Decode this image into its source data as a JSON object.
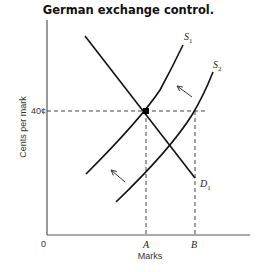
{
  "chart_data": {
    "type": "line",
    "title": "German exchange control.",
    "xlabel": "Marks",
    "ylabel": "Cents per mark",
    "origin_label": "0",
    "y_ticks": [
      {
        "label": "40¢",
        "value": 40
      }
    ],
    "x_ticks": [
      {
        "label": "A",
        "value": "A"
      },
      {
        "label": "B",
        "value": "B"
      }
    ],
    "xlim": [
      0,
      100
    ],
    "ylim": [
      0,
      100
    ],
    "grid": false,
    "series": [
      {
        "name": "D1",
        "label": "D",
        "sub": "1",
        "shape": "downward-sloping straight line",
        "points": [
          [
            19,
            92
          ],
          [
            73,
            27
          ]
        ]
      },
      {
        "name": "S1",
        "label": "S",
        "sub": "1",
        "shape": "upward-sloping convex curve",
        "points": [
          [
            19,
            28
          ],
          [
            40,
            42
          ],
          [
            49,
            57
          ],
          [
            60,
            75
          ],
          [
            66,
            87
          ]
        ]
      },
      {
        "name": "S2",
        "label": "S",
        "sub": "2",
        "shape": "upward-sloping convex curve",
        "points": [
          [
            34,
            15
          ],
          [
            55,
            30
          ],
          [
            73,
            57
          ],
          [
            80,
            75
          ],
          [
            82,
            75
          ]
        ]
      }
    ],
    "annotations": [
      {
        "type": "point",
        "name": "equilibrium",
        "x": "A",
        "y": 40,
        "note": "S1 ∩ D1"
      },
      {
        "type": "dashed-line",
        "from": "40¢ on y-axis",
        "to": "B at 40¢"
      },
      {
        "type": "dashed-line",
        "from": "A on x-axis",
        "to": "equilibrium"
      },
      {
        "type": "dashed-line",
        "from": "B on x-axis",
        "to": "S2 at 40¢"
      },
      {
        "type": "arrow",
        "direction": "up-left",
        "meaning": "shift from S2 toward S1 (upper)"
      },
      {
        "type": "arrow",
        "direction": "up-left",
        "meaning": "shift from S2 toward S1 (lower)"
      }
    ]
  }
}
